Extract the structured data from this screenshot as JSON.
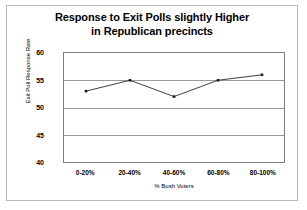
{
  "chart_data": {
    "type": "line",
    "title": "Response to Exit Polls slightly Higher in Republican precincts",
    "title_line1": "Response to Exit Polls slightly Higher",
    "title_line2": "in Republican precincts",
    "xlabel": "% Bush Voters",
    "ylabel": "Exit Poll Response Rate",
    "categories": [
      "0-20%",
      "20-40%",
      "40-60%",
      "60-80%",
      "80-100%"
    ],
    "values": [
      53,
      55,
      52,
      55,
      56
    ],
    "series": [
      {
        "name": "Exit Poll Response Rate",
        "values": [
          53,
          55,
          52,
          55,
          56
        ]
      }
    ],
    "ylim": [
      40,
      60
    ],
    "yticks": [
      40,
      45,
      50,
      55,
      60
    ],
    "ytick_labels": [
      "40",
      "45",
      "50",
      "55",
      "60"
    ],
    "grid": true,
    "grid_axis": "y",
    "legend": false,
    "legend_position": "none",
    "marker": "square",
    "line_color": "#3d3d3d",
    "marker_color": "#1a1a1a",
    "grid_color": "#9a9a9a",
    "plot_border_color": "#7c7c7c",
    "frame_color": "#b9b9b9",
    "background_color": "#ffffff",
    "text_color": "#000000"
  }
}
